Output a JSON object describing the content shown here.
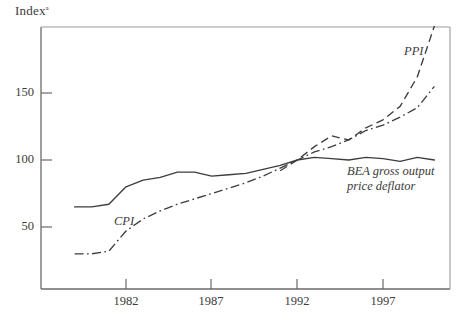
{
  "chart_data": {
    "type": "line",
    "title": "",
    "xlabel": "",
    "ylabel": "Index",
    "ylabel_superscript": "a",
    "xlim": [
      1979,
      2000.8
    ],
    "ylim": [
      13,
      206
    ],
    "grid": false,
    "legend": "inline-annotations",
    "yticks": [
      50,
      100,
      150
    ],
    "ytick_labels": [
      "50",
      "100",
      "150"
    ],
    "xticks": [
      1982,
      1987,
      1992,
      1997
    ],
    "xtick_labels": [
      "1982",
      "1987",
      "1992",
      "1997"
    ],
    "series": [
      {
        "name": "BEA gross output price deflator",
        "label_lines": [
          "BEA gross output",
          "price deflator"
        ],
        "style": "solid",
        "x": [
          1979,
          1980,
          1981,
          1982,
          1983,
          1984,
          1985,
          1986,
          1987,
          1988,
          1989,
          1990,
          1991,
          1992,
          1993,
          1994,
          1995,
          1996,
          1997,
          1998,
          1999,
          2000
        ],
        "values": [
          65,
          65,
          67,
          80,
          85,
          87,
          91,
          91,
          88,
          89,
          90,
          93,
          96,
          100,
          102,
          101,
          100,
          102,
          101,
          99,
          102,
          100
        ]
      },
      {
        "name": "CPI",
        "label_lines": [
          "CPI"
        ],
        "style": "dash-dot",
        "x": [
          1979,
          1980,
          1981,
          1982,
          1983,
          1984,
          1985,
          1986,
          1987,
          1988,
          1989,
          1990,
          1991,
          1992,
          1993,
          1994,
          1995,
          1996,
          1997,
          1998,
          1999,
          2000
        ],
        "values": [
          30,
          30,
          32,
          47,
          56,
          62,
          67,
          71,
          75,
          79,
          83,
          88,
          94,
          100,
          106,
          110,
          115,
          122,
          126,
          132,
          139,
          155
        ]
      },
      {
        "name": "PPI",
        "label_lines": [
          "PPI"
        ],
        "style": "dashed",
        "x": [
          1991,
          1992,
          1993,
          1994,
          1995,
          1996,
          1997,
          1998,
          1999,
          2000
        ],
        "values": [
          92,
          100,
          110,
          118,
          115,
          124,
          130,
          140,
          162,
          200
        ]
      }
    ]
  },
  "axis": {
    "y_title": "Index",
    "y_title_superscript": "a"
  }
}
